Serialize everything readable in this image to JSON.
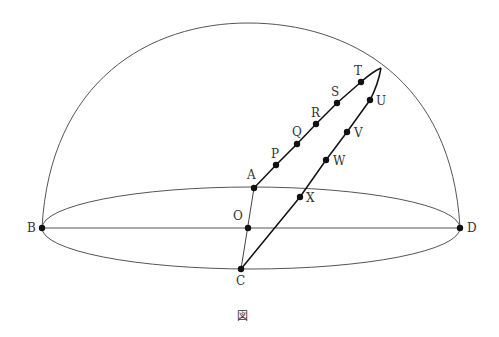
{
  "figure": {
    "caption": "図",
    "colors": {
      "stroke": "#444444",
      "thick": "#111111",
      "point": "#111111",
      "label": "#333333"
    }
  },
  "points": [
    {
      "id": "A",
      "label": "A",
      "x": 254,
      "y": 188
    },
    {
      "id": "B",
      "label": "B",
      "x": 42,
      "y": 228
    },
    {
      "id": "C",
      "label": "C",
      "x": 241,
      "y": 269
    },
    {
      "id": "D",
      "label": "D",
      "x": 460,
      "y": 228
    },
    {
      "id": "O",
      "label": "O",
      "x": 248,
      "y": 228
    },
    {
      "id": "P",
      "label": "P",
      "x": 276,
      "y": 165
    },
    {
      "id": "Q",
      "label": "Q",
      "x": 297,
      "y": 144
    },
    {
      "id": "R",
      "label": "R",
      "x": 316,
      "y": 124
    },
    {
      "id": "S",
      "label": "S",
      "x": 337,
      "y": 103
    },
    {
      "id": "T",
      "label": "T",
      "x": 361,
      "y": 82
    },
    {
      "id": "U",
      "label": "U",
      "x": 370,
      "y": 100
    },
    {
      "id": "V",
      "label": "V",
      "x": 347,
      "y": 132
    },
    {
      "id": "W",
      "label": "W",
      "x": 326,
      "y": 160
    },
    {
      "id": "X",
      "label": "X",
      "x": 300,
      "y": 197
    }
  ],
  "labels": {
    "A": "A",
    "B": "B",
    "C": "C",
    "D": "D",
    "O": "O",
    "P": "P",
    "Q": "Q",
    "R": "R",
    "S": "S",
    "T": "T",
    "U": "U",
    "V": "V",
    "W": "W",
    "X": "X"
  }
}
